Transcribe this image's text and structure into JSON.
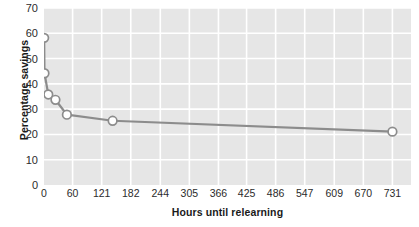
{
  "chart_data": {
    "type": "line",
    "title": "",
    "xlabel": "Hours until relearning",
    "ylabel": "Percentage savings",
    "xlim": [
      0,
      770
    ],
    "ylim": [
      0,
      70
    ],
    "grid": true,
    "legend": false,
    "x_ticks": [
      0,
      60,
      121,
      182,
      244,
      305,
      366,
      425,
      486,
      547,
      609,
      670,
      731
    ],
    "y_ticks": [
      0,
      10,
      20,
      30,
      40,
      50,
      60,
      70
    ],
    "x": [
      0.33,
      1,
      9,
      24,
      48,
      144,
      731
    ],
    "values": [
      58.2,
      44.2,
      35.8,
      33.7,
      27.8,
      25.4,
      21.1
    ],
    "series": [
      {
        "name": "Percentage savings",
        "x": [
          0.33,
          1,
          9,
          24,
          48,
          144,
          731
        ],
        "values": [
          58.2,
          44.2,
          35.8,
          33.7,
          27.8,
          25.4,
          21.1
        ]
      }
    ],
    "marker": "circle-open",
    "line_color": "#8c8c8c",
    "marker_fill": "#ffffff",
    "marker_edge": "#8c8c8c",
    "plot_background": "#e6e6e6",
    "grid_color": "#ffffff",
    "figure_background": "#ffffff"
  }
}
